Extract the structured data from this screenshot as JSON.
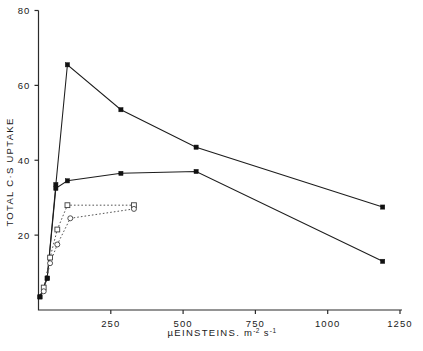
{
  "chart_data": {
    "type": "line",
    "title": "",
    "xlabel": "µEINSTEINS. m-2 s-1",
    "xlabel_parts": {
      "main": "µEINSTEINS. m",
      "sup1": "-2",
      "mid": " s",
      "sup2": "-1"
    },
    "ylabel": "TOTAL C·S UPTAKE",
    "xlim": [
      0,
      1300
    ],
    "ylim": [
      0,
      80
    ],
    "xticks": [
      250,
      500,
      750,
      1000,
      1250
    ],
    "xtick_labels": [
      "250",
      "500",
      "750",
      "1000",
      "1250"
    ],
    "yticks": [
      20,
      40,
      60,
      80
    ],
    "ytick_labels": [
      "20",
      "40",
      "60",
      "80"
    ],
    "grid": false,
    "legend_position": "none",
    "series": [
      {
        "name": "upper-solid",
        "line_style": "solid",
        "marker": "filled-square",
        "x": [
          5,
          30,
          60,
          100,
          285,
          545,
          1190
        ],
        "y": [
          3.5,
          8.5,
          33.5,
          65.5,
          53.5,
          43.5,
          27.5
        ]
      },
      {
        "name": "lower-solid",
        "line_style": "solid",
        "marker": "filled-square",
        "x": [
          5,
          30,
          60,
          100,
          285,
          545,
          1190
        ],
        "y": [
          3.5,
          8.5,
          32.5,
          34.5,
          36.5,
          37.0,
          13.0
        ]
      },
      {
        "name": "upper-dotted",
        "line_style": "dotted",
        "marker": "open-square",
        "x": [
          18,
          40,
          65,
          100,
          330
        ],
        "y": [
          6.0,
          14.0,
          21.5,
          28.0,
          28.0
        ]
      },
      {
        "name": "lower-dotted",
        "line_style": "dotted",
        "marker": "open-circle",
        "x": [
          18,
          40,
          65,
          110,
          330
        ],
        "y": [
          5.0,
          12.5,
          17.5,
          24.5,
          27.0
        ]
      }
    ]
  }
}
